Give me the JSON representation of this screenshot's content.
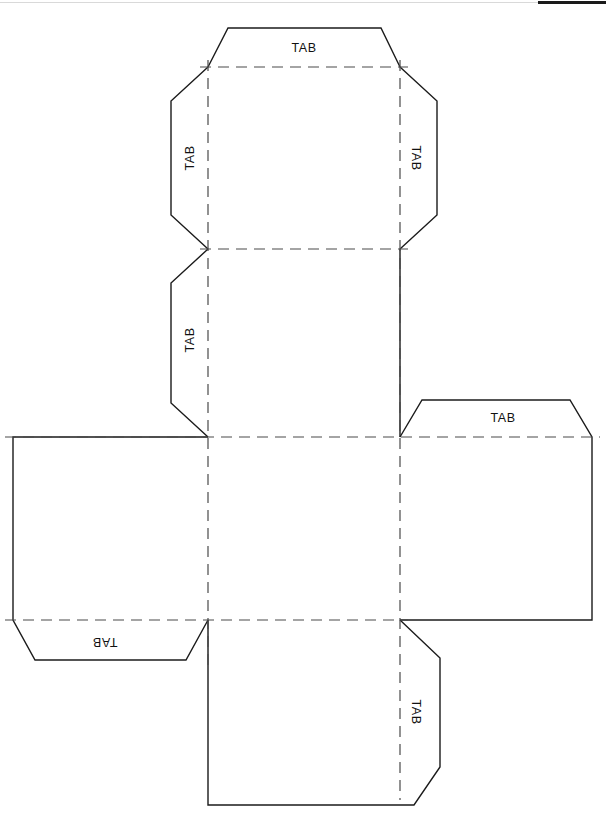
{
  "document": {
    "type": "cube-net-papercraft-template",
    "title": "Cube Net with Glue Tabs",
    "background_color": "#ffffff",
    "cut_line_color": "#1b1b1b",
    "fold_line_color": "#4a4a4a",
    "text_color": "#111111",
    "page_width": 606,
    "page_height": 820
  },
  "header": {
    "rule_color": "#d9d9d9",
    "black_bar_color": "#1a1a1a"
  },
  "net": {
    "columns": [
      13,
      208,
      400,
      592
    ],
    "rows": [
      67,
      249,
      437,
      620,
      805
    ],
    "top_tab_apex_y": 28,
    "tab_depth": 40,
    "tab_slope": 22,
    "panels": [
      {
        "name": "top-face",
        "x": 208,
        "y": 67,
        "w": 192,
        "h": 182
      },
      {
        "name": "upper-middle-face",
        "x": 208,
        "y": 249,
        "w": 192,
        "h": 188
      },
      {
        "name": "center-face",
        "x": 208,
        "y": 437,
        "w": 192,
        "h": 183
      },
      {
        "name": "bottom-face",
        "x": 208,
        "y": 620,
        "w": 192,
        "h": 185
      },
      {
        "name": "left-face",
        "x": 13,
        "y": 437,
        "w": 195,
        "h": 183
      },
      {
        "name": "right-face",
        "x": 400,
        "y": 437,
        "w": 192,
        "h": 183
      }
    ]
  },
  "tabs": [
    {
      "id": "tab-top",
      "label": "TAB",
      "orientation": "horizontal",
      "rotation": 0,
      "x": 304,
      "y": 48
    },
    {
      "id": "tab-top-left",
      "label": "TAB",
      "orientation": "vertical-ccw",
      "rotation": -90,
      "x": 191,
      "y": 158
    },
    {
      "id": "tab-top-right",
      "label": "TAB",
      "orientation": "vertical-cw",
      "rotation": 90,
      "x": 414,
      "y": 158
    },
    {
      "id": "tab-middle-left",
      "label": "TAB",
      "orientation": "vertical-ccw",
      "rotation": -90,
      "x": 191,
      "y": 340
    },
    {
      "id": "tab-right-top",
      "label": "TAB",
      "orientation": "horizontal",
      "rotation": 0,
      "x": 502,
      "y": 418
    },
    {
      "id": "tab-left-bottom",
      "label": "TAB",
      "orientation": "horizontal",
      "rotation": 180,
      "x": 105,
      "y": 641
    },
    {
      "id": "tab-bottom-right",
      "label": "TAB",
      "orientation": "vertical-cw",
      "rotation": 90,
      "x": 414,
      "y": 712
    }
  ],
  "geometry": {
    "cut_outline": "M 228 28 L 381 28 L 400 67 L 436 101 L 436 215 L 400 249 L 418 249 L 418 385 L 400 437 L 421 400 L 570 400 L 592 437 L 592 620 L 440 620 L 440 660 L 440 765 L 414 805 L 208 805 L 208 660 L 191 660 L 40 660 L 13 620 L 13 437 L 184 437 L 170 400 L 170 290 L 170 249 L 190 249 L 170 215 L 170 101 L 208 67 Z",
    "fold_vertical_left_x": 208,
    "fold_vertical_right_x": 400,
    "fold_horizontal_ys": [
      67,
      249,
      437,
      620
    ]
  }
}
